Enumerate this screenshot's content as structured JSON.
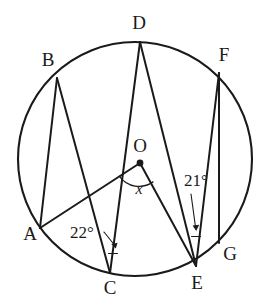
{
  "figure": {
    "type": "circle-geometry-diagram",
    "background_color": "#ffffff",
    "ink_color": "#1a1a1a"
  },
  "circle": {
    "name": "main-circle",
    "center_x": 135,
    "center_y": 159,
    "radius": 117
  },
  "points": [
    {
      "id": "A",
      "label": "A",
      "x": 40,
      "y": 228,
      "label_x": 30,
      "label_y": 236
    },
    {
      "id": "B",
      "label": "B",
      "x": 57,
      "y": 78,
      "label_x": 48,
      "label_y": 62
    },
    {
      "id": "C",
      "label": "C",
      "x": 110,
      "y": 273,
      "label_x": 110,
      "label_y": 290
    },
    {
      "id": "D",
      "label": "D",
      "x": 140,
      "y": 42,
      "label_x": 139,
      "label_y": 25
    },
    {
      "id": "E",
      "label": "E",
      "x": 196,
      "y": 266,
      "label_x": 197,
      "label_y": 285
    },
    {
      "id": "F",
      "label": "F",
      "x": 219,
      "y": 73,
      "label_x": 224,
      "label_y": 57
    },
    {
      "id": "G",
      "label": "G",
      "x": 219,
      "y": 243,
      "label_x": 230,
      "label_y": 256
    },
    {
      "id": "O",
      "label": "O",
      "x": 140,
      "y": 163,
      "label_x": 140,
      "label_y": 148
    }
  ],
  "chords": [
    {
      "name": "chord-B-A",
      "from": "B",
      "to": "A"
    },
    {
      "name": "chord-B-C",
      "from": "B",
      "to": "C"
    },
    {
      "name": "chord-D-C",
      "from": "D",
      "to": "C"
    },
    {
      "name": "chord-D-E",
      "from": "D",
      "to": "E"
    },
    {
      "name": "chord-F-E",
      "from": "F",
      "to": "E"
    },
    {
      "name": "chord-F-G",
      "from": "F",
      "to": "G"
    },
    {
      "name": "radius-O-A",
      "from": "O",
      "to": "A"
    },
    {
      "name": "radius-O-E",
      "from": "O",
      "to": "E"
    }
  ],
  "angles": [
    {
      "id": "angle-at-C",
      "label": "22°",
      "value": 22,
      "unit": "degrees",
      "vertex": "C",
      "label_x": 82,
      "label_y": 234,
      "leader_from_x": 104,
      "leader_from_y": 232,
      "leader_to_x": 115,
      "leader_to_y": 248
    },
    {
      "id": "angle-at-E",
      "label": "21°",
      "value": 21,
      "unit": "degrees",
      "vertex": "E",
      "label_x": 196,
      "label_y": 182,
      "leader_from_x": 192,
      "leader_from_y": 194,
      "leader_to_x": 196,
      "leader_to_y": 231
    },
    {
      "id": "angle-at-O",
      "label": "x",
      "value": null,
      "unit": "unknown",
      "vertex": "O",
      "label_x": 139,
      "label_y": 190
    }
  ]
}
